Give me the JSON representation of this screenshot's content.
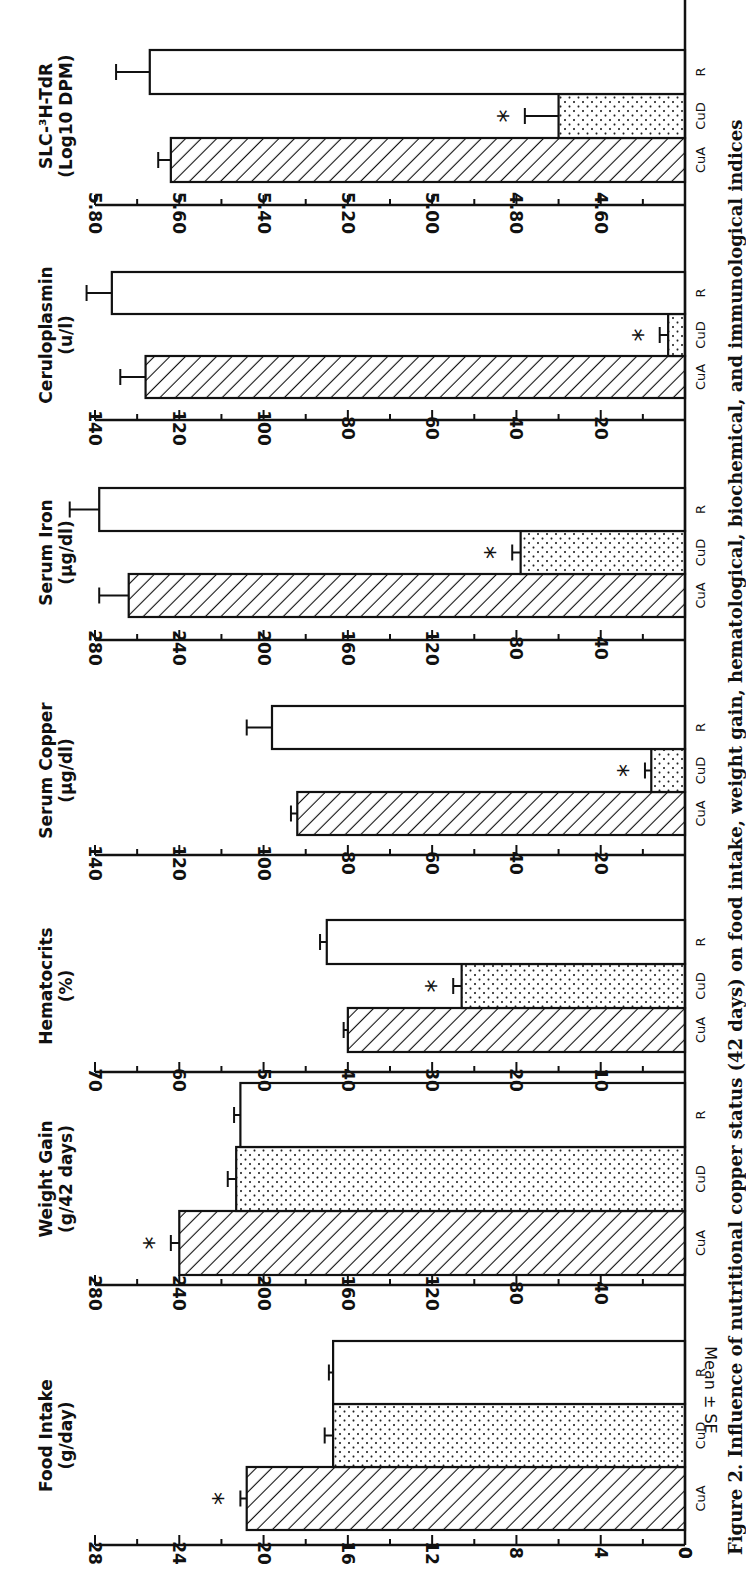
{
  "figure": {
    "caption": "Figure 2. Influence of nutritional copper status (42 days) on food intake, weight gain, hematological, biochemical, and immunological indices",
    "shared_ylabel": "Mean ± SE",
    "groups": [
      "CuA",
      "CuD",
      "R"
    ],
    "significance_marker": "*"
  },
  "colors": {
    "ink": "#111111",
    "background": "#ffffff"
  },
  "chart_data": [
    {
      "type": "bar",
      "title": "Food Intake",
      "unit_label": "(g/day)",
      "ylabel": "Mean ± SE",
      "categories": [
        "CuA",
        "CuD",
        "R"
      ],
      "values": [
        20.8,
        16.7,
        16.7
      ],
      "errors": [
        0.3,
        0.4,
        0.2
      ],
      "significant": [
        true,
        false,
        false
      ],
      "ylim": [
        0,
        28
      ],
      "ticks": [
        0,
        4,
        8,
        12,
        16,
        20,
        24,
        28
      ],
      "tick_labels": [
        "0",
        "4",
        "8",
        "12",
        "16",
        "20",
        "24",
        "28"
      ],
      "minor_step": 2
    },
    {
      "type": "bar",
      "title": "Weight Gain",
      "unit_label": "(g/42 days)",
      "categories": [
        "CuA",
        "CuD",
        "R"
      ],
      "values": [
        240,
        213,
        211
      ],
      "errors": [
        4,
        4,
        3
      ],
      "significant": [
        true,
        false,
        false
      ],
      "ylim": [
        0,
        280
      ],
      "ticks": [
        40,
        80,
        120,
        160,
        200,
        240,
        280
      ],
      "tick_labels": [
        "40",
        "80",
        "120",
        "160",
        "200",
        "240",
        "280"
      ],
      "minor_step": 20
    },
    {
      "type": "bar",
      "title": "Hematocrits",
      "unit_label": "(%)",
      "categories": [
        "CuA",
        "CuD",
        "R"
      ],
      "values": [
        40,
        26.5,
        42.5
      ],
      "errors": [
        0.5,
        1.0,
        0.8
      ],
      "significant": [
        false,
        true,
        false
      ],
      "ylim": [
        0,
        70
      ],
      "ticks": [
        10,
        20,
        30,
        40,
        50,
        60,
        70
      ],
      "tick_labels": [
        "10",
        "20",
        "30",
        "40",
        "50",
        "60",
        "70"
      ],
      "minor_step": 5
    },
    {
      "type": "bar",
      "title": "Serum Copper",
      "unit_label": "(µg/dl)",
      "categories": [
        "CuA",
        "CuD",
        "R"
      ],
      "values": [
        92,
        8,
        98
      ],
      "errors": [
        1.5,
        1.5,
        6
      ],
      "significant": [
        false,
        true,
        false
      ],
      "ylim": [
        0,
        140
      ],
      "ticks": [
        20,
        40,
        60,
        80,
        100,
        120,
        140
      ],
      "tick_labels": [
        "20",
        "40",
        "60",
        "80",
        "100",
        "120",
        "140"
      ],
      "minor_step": 10
    },
    {
      "type": "bar",
      "title": "Serum Iron",
      "unit_label": "(µg/dl)",
      "categories": [
        "CuA",
        "CuD",
        "R"
      ],
      "values": [
        264,
        78,
        278
      ],
      "errors": [
        14,
        4,
        14
      ],
      "significant": [
        false,
        true,
        false
      ],
      "ylim": [
        0,
        280
      ],
      "ticks": [
        40,
        80,
        120,
        160,
        200,
        240,
        280
      ],
      "tick_labels": [
        "40",
        "80",
        "120",
        "160",
        "200",
        "240",
        "280"
      ],
      "minor_step": 20
    },
    {
      "type": "bar",
      "title": "Ceruloplasmin",
      "unit_label": "(u/l)",
      "categories": [
        "CuA",
        "CuD",
        "R"
      ],
      "values": [
        128,
        4,
        136
      ],
      "errors": [
        6,
        2,
        6
      ],
      "significant": [
        false,
        true,
        false
      ],
      "ylim": [
        0,
        140
      ],
      "ticks": [
        20,
        40,
        60,
        80,
        100,
        120,
        140
      ],
      "tick_labels": [
        "20",
        "40",
        "60",
        "80",
        "100",
        "120",
        "140"
      ],
      "minor_step": 10
    },
    {
      "type": "bar",
      "title": "SLC-³H-TdR",
      "unit_label": "(Log10 DPM)",
      "categories": [
        "CuA",
        "CuD",
        "R"
      ],
      "values": [
        5.62,
        4.7,
        5.67
      ],
      "errors": [
        0.03,
        0.08,
        0.08
      ],
      "significant": [
        false,
        true,
        false
      ],
      "ylim": [
        4.4,
        5.8
      ],
      "ticks": [
        4.6,
        4.8,
        5.0,
        5.2,
        5.4,
        5.6,
        5.8
      ],
      "tick_labels": [
        "4.60",
        "4.80",
        "5.00",
        "5.20",
        "5.40",
        "5.60",
        "5.80"
      ],
      "minor_step": 0.1
    }
  ]
}
